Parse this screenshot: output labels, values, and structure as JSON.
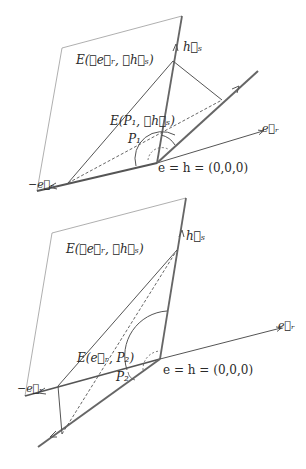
{
  "diagrams": [
    {
      "id": "top",
      "plane_label": "E(∡e⃗ᵣ, ∡h⃗ₛ)",
      "subplane_label": "E(P₁, ∡h⃗ₛ)",
      "point_label": "P₁",
      "axis_hs_label": "h⃗ₛ",
      "axis_er_label": "e⃗ᵣ",
      "axis_neg_er_label": "−e⃗ᵣ",
      "origin_label": "e = h = (0,0,0)"
    },
    {
      "id": "bottom",
      "plane_label": "E(∡e⃗ᵣ, ∡h⃗ₛ)",
      "subplane_label": "E(e⃗ᵣ, P₂)",
      "point_label": "P₂",
      "axis_hs_label": "h⃗ₛ",
      "axis_er_label": "e⃗ᵣ",
      "axis_neg_er_label": "−e⃗ᵣ",
      "origin_label": "e = h = (0,0,0)"
    }
  ],
  "colors": {
    "line": "#555555",
    "thin": "#8a8a8a",
    "text": "#2a2a2a"
  }
}
